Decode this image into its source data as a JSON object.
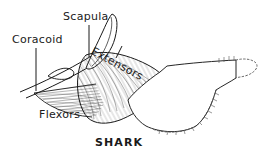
{
  "figure": {
    "caption": "SHARK",
    "background_color": "#ffffff",
    "ink_color": "#1a1a1a",
    "labels": [
      {
        "id": "coracoid",
        "text": "Coracoid",
        "rotation_deg": 0,
        "leader": "vertical-line-down"
      },
      {
        "id": "scapula",
        "text": "Scapula",
        "rotation_deg": 0,
        "leader": "vertical-line-down"
      },
      {
        "id": "extensors",
        "text": "Extensors",
        "rotation_deg": 28,
        "leader": "short-diagonal-line"
      },
      {
        "id": "flexors",
        "text": "Flexors",
        "rotation_deg": 0,
        "leader": "none"
      }
    ],
    "structures": [
      {
        "name": "scapula-blade",
        "style": "outline"
      },
      {
        "name": "coracoid-bar",
        "style": "outline"
      },
      {
        "name": "extensor-muscle",
        "style": "curved-fiber-hatching"
      },
      {
        "name": "flexor-muscle",
        "style": "fine-horizontal-hatching"
      },
      {
        "name": "fin-web",
        "style": "outline"
      },
      {
        "name": "fin-radial-margin",
        "style": "stippled-dashed-edge"
      }
    ]
  }
}
